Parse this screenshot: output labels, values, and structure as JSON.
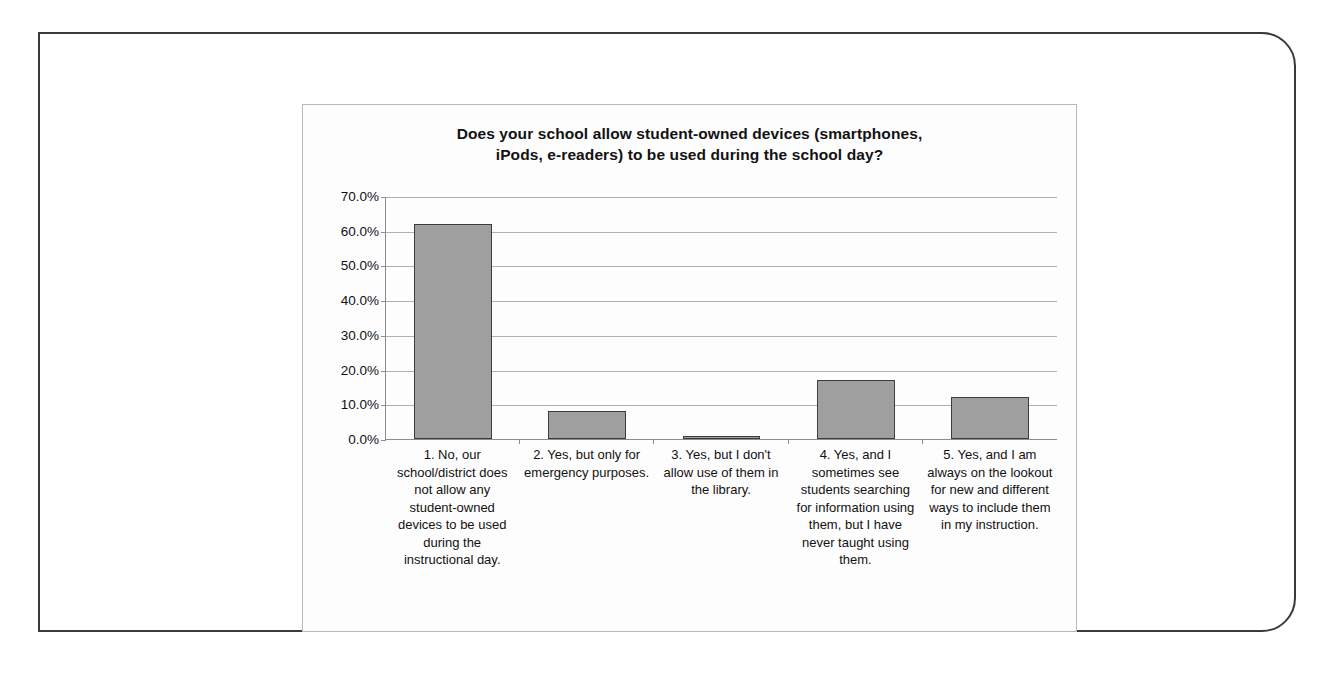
{
  "chart_data": {
    "type": "bar",
    "title": "Does your school allow student-owned devices (smartphones, iPods, e-readers) to be used during the school day?",
    "title_line1": "Does your school allow student-owned devices (smartphones,",
    "title_line2": "iPods, e-readers) to be used during the school day?",
    "categories": [
      "1. No, our school/district does not allow any student-owned devices to be used during the instructional day.",
      "2. Yes, but only for emergency purposes.",
      "3. Yes, but I don't allow use of them in the library.",
      "4. Yes, and I sometimes see students searching for information using them, but I have never taught using them.",
      "5. Yes, and I am always on the lookout for new and different ways to include them in my instruction."
    ],
    "values": [
      62.0,
      8.0,
      1.0,
      17.0,
      12.0
    ],
    "xlabel": "",
    "ylabel": "",
    "ylim": [
      0,
      70
    ],
    "ytick_labels": [
      "70.0%",
      "60.0%",
      "50.0%",
      "40.0%",
      "30.0%",
      "20.0%",
      "10.0%",
      "0.0%"
    ],
    "ytick_values": [
      70,
      60,
      50,
      40,
      30,
      20,
      10,
      0
    ],
    "grid": true,
    "legend": false,
    "bar_color": "#9f9f9f",
    "bar_border_color": "#3d3d3d",
    "gridline_color": "#b0b0b0",
    "axis_color": "#8d8d8d"
  }
}
